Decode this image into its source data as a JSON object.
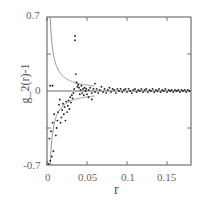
{
  "chart_data": {
    "type": "scatter",
    "title": "",
    "xlabel": "r",
    "ylabel": "g_2(r)-1",
    "xlim": [
      0,
      0.18
    ],
    "ylim": [
      -0.7,
      0.7
    ],
    "x_ticks": [
      0,
      0.05,
      0.1,
      0.15
    ],
    "x_tick_labels": [
      "0",
      "0.05",
      "0.1",
      "0.15"
    ],
    "y_ticks": [
      -0.7,
      0,
      0.7
    ],
    "y_tick_labels": [
      "-0.7",
      "0",
      "0.7"
    ],
    "grid": false,
    "legend": null,
    "reference_lines": [
      {
        "name": "zero line",
        "type": "horizontal",
        "y": 0
      },
      {
        "name": "upper envelope",
        "type": "curve",
        "description": "+a/r decay from ~0.7 near r=0 toward 0"
      },
      {
        "name": "lower envelope",
        "type": "curve",
        "description": "-a/r decay from ~-0.7 near r=0 toward 0"
      }
    ],
    "series": [
      {
        "name": "data",
        "marker": "dot",
        "points": [
          [
            0.002,
            -0.69
          ],
          [
            0.004,
            -0.66
          ],
          [
            0.006,
            -0.62
          ],
          [
            0.008,
            -0.57
          ],
          [
            0.003,
            -0.45
          ],
          [
            0.005,
            -0.38
          ],
          [
            0.007,
            -0.3
          ],
          [
            0.009,
            -0.22
          ],
          [
            0.004,
            0.05
          ],
          [
            0.007,
            0.05
          ],
          [
            0.011,
            -0.42
          ],
          [
            0.012,
            -0.35
          ],
          [
            0.013,
            -0.28
          ],
          [
            0.014,
            -0.2
          ],
          [
            0.015,
            -0.13
          ],
          [
            0.016,
            -0.08
          ],
          [
            0.017,
            -0.3
          ],
          [
            0.018,
            -0.25
          ],
          [
            0.019,
            -0.18
          ],
          [
            0.02,
            -0.12
          ],
          [
            0.021,
            -0.22
          ],
          [
            0.022,
            -0.15
          ],
          [
            0.023,
            -0.28
          ],
          [
            0.024,
            -0.1
          ],
          [
            0.025,
            -0.2
          ],
          [
            0.026,
            -0.14
          ],
          [
            0.027,
            -0.09
          ],
          [
            0.028,
            -0.17
          ],
          [
            0.029,
            -0.06
          ],
          [
            0.03,
            -0.11
          ],
          [
            0.031,
            -0.04
          ],
          [
            0.032,
            -0.07
          ],
          [
            0.033,
            -0.02
          ],
          [
            0.034,
            0.02
          ],
          [
            0.035,
            0.52
          ],
          [
            0.035,
            0.48
          ],
          [
            0.036,
            0.16
          ],
          [
            0.037,
            0.08
          ],
          [
            0.038,
            0.04
          ],
          [
            0.039,
            0.06
          ],
          [
            0.04,
            0.03
          ],
          [
            0.041,
            -0.03
          ],
          [
            0.042,
            0.01
          ],
          [
            0.043,
            0.05
          ],
          [
            0.044,
            -0.02
          ],
          [
            0.045,
            0.02
          ],
          [
            0.046,
            -0.04
          ],
          [
            0.047,
            0.03
          ],
          [
            0.048,
            0.0
          ],
          [
            0.049,
            0.02
          ],
          [
            0.05,
            -0.03
          ],
          [
            0.052,
            0.01
          ],
          [
            0.054,
            0.03
          ],
          [
            0.056,
            -0.02
          ],
          [
            0.058,
            0.02
          ],
          [
            0.06,
            -0.01
          ],
          [
            0.062,
            0.02
          ],
          [
            0.064,
            -0.02
          ],
          [
            0.066,
            0.01
          ],
          [
            0.068,
            0.04
          ],
          [
            0.07,
            -0.01
          ],
          [
            0.072,
            0.02
          ],
          [
            0.074,
            -0.02
          ],
          [
            0.076,
            0.01
          ],
          [
            0.078,
            0.03
          ],
          [
            0.08,
            -0.01
          ],
          [
            0.082,
            0.02
          ],
          [
            0.084,
            0.01
          ],
          [
            0.086,
            -0.02
          ],
          [
            0.088,
            0.02
          ],
          [
            0.09,
            0.0
          ],
          [
            0.092,
            0.02
          ],
          [
            0.094,
            -0.01
          ],
          [
            0.096,
            0.01
          ],
          [
            0.098,
            0.02
          ],
          [
            0.1,
            -0.01
          ],
          [
            0.102,
            0.02
          ],
          [
            0.104,
            0.0
          ],
          [
            0.106,
            -0.02
          ],
          [
            0.108,
            0.01
          ],
          [
            0.11,
            0.02
          ],
          [
            0.112,
            -0.01
          ],
          [
            0.114,
            0.01
          ],
          [
            0.116,
            0.0
          ],
          [
            0.118,
            0.02
          ],
          [
            0.12,
            -0.01
          ],
          [
            0.122,
            0.01
          ],
          [
            0.124,
            0.02
          ],
          [
            0.126,
            -0.01
          ],
          [
            0.128,
            0.01
          ],
          [
            0.13,
            0.0
          ],
          [
            0.132,
            0.02
          ],
          [
            0.134,
            -0.01
          ],
          [
            0.136,
            0.01
          ],
          [
            0.138,
            0.0
          ],
          [
            0.14,
            0.02
          ],
          [
            0.142,
            -0.01
          ],
          [
            0.144,
            0.01
          ],
          [
            0.146,
            0.0
          ],
          [
            0.148,
            0.02
          ],
          [
            0.15,
            -0.01
          ],
          [
            0.152,
            0.01
          ],
          [
            0.154,
            0.0
          ],
          [
            0.156,
            0.01
          ],
          [
            0.158,
            -0.01
          ],
          [
            0.16,
            0.01
          ],
          [
            0.162,
            0.0
          ],
          [
            0.164,
            0.01
          ],
          [
            0.166,
            -0.01
          ],
          [
            0.168,
            0.01
          ],
          [
            0.17,
            0.0
          ],
          [
            0.172,
            0.01
          ],
          [
            0.174,
            -0.01
          ],
          [
            0.176,
            0.01
          ],
          [
            0.178,
            0.0
          ],
          [
            0.06,
            0.07
          ],
          [
            0.052,
            -0.06
          ],
          [
            0.056,
            -0.08
          ]
        ]
      }
    ]
  },
  "colors": {
    "axis": "#555555",
    "points": "#222222",
    "curves": "#888888"
  }
}
